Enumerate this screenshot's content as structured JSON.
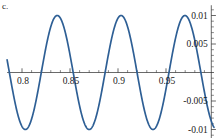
{
  "panel": {
    "label": "c."
  },
  "chart_data": {
    "type": "line",
    "title": "",
    "subtitle": "",
    "xlabel": "",
    "ylabel": "",
    "legend": [],
    "legend_position": "none",
    "grid": false,
    "axis_style": "crosshair-at-origin",
    "xlim": [
      0.7845,
      1.0
    ],
    "ylim": [
      -0.0118,
      0.0118
    ],
    "x_ticks_major": [
      0.8,
      0.85,
      0.9,
      0.95
    ],
    "x_tick_labels": [
      "0.8",
      "0.85",
      "0.9",
      "0.95"
    ],
    "x_ticks_minor": [
      0.81,
      0.82,
      0.83,
      0.84,
      0.86,
      0.87,
      0.88,
      0.89,
      0.91,
      0.92,
      0.93,
      0.94,
      0.96,
      0.97,
      0.98,
      0.99
    ],
    "y_ticks_major": [
      0.01,
      0.005,
      -0.005,
      -0.01
    ],
    "y_tick_labels": [
      "0.01",
      "0.005",
      "-0.005",
      "-0.01"
    ],
    "y_ticks_minor": [
      0.009,
      0.008,
      0.007,
      0.006,
      0.004,
      0.003,
      0.002,
      0.001,
      -0.001,
      -0.002,
      -0.003,
      -0.004,
      -0.006,
      -0.007,
      -0.008,
      -0.009,
      -0.011,
      0.011
    ],
    "y_axis_position": "right",
    "x_axis_position": "y=0",
    "series": [
      {
        "name": "oscillation",
        "color": "#2e5f95",
        "amplitude": 0.01,
        "period": 0.0665,
        "description": "sinusoidal oscillation of amplitude 0.01 with period about 0.0665 in x",
        "x": [
          0.7845,
          0.7878,
          0.7911,
          0.7945,
          0.7978,
          0.8011,
          0.8045,
          0.8078,
          0.8111,
          0.8145,
          0.8178,
          0.8211,
          0.8245,
          0.8278,
          0.8311,
          0.8345,
          0.8378,
          0.8411,
          0.8445,
          0.8478,
          0.8511,
          0.8545,
          0.8578,
          0.8611,
          0.8645,
          0.8678,
          0.8711,
          0.8745,
          0.8778,
          0.8811,
          0.8845,
          0.8878,
          0.8911,
          0.8945,
          0.8978,
          0.9011,
          0.9045,
          0.9078,
          0.9111,
          0.9145,
          0.9178,
          0.9211,
          0.9245,
          0.9278,
          0.9311,
          0.9345,
          0.9378,
          0.9411,
          0.9445,
          0.9478,
          0.9511,
          0.9545,
          0.9578,
          0.9611,
          0.9645,
          0.9678,
          0.9711,
          0.9745,
          0.9778,
          0.9811,
          0.9845,
          0.9878,
          0.9911,
          0.9945,
          0.9978,
          1.0
        ],
        "y": [
          0.0022,
          -0.0009,
          -0.004,
          -0.0066,
          -0.0086,
          -0.0098,
          -0.01,
          -0.0093,
          -0.0077,
          -0.0054,
          -0.0026,
          0.0005,
          0.0035,
          0.0062,
          0.0084,
          0.0097,
          0.01,
          0.0094,
          0.0079,
          0.0057,
          0.003,
          0.0,
          -0.003,
          -0.0058,
          -0.008,
          -0.0095,
          -0.01,
          -0.0096,
          -0.0082,
          -0.0061,
          -0.0034,
          -0.0005,
          0.0026,
          0.0054,
          0.0078,
          0.0093,
          0.01,
          0.0097,
          0.0085,
          0.0065,
          0.0039,
          0.001,
          -0.0021,
          -0.005,
          -0.0074,
          -0.0091,
          -0.0099,
          -0.0098,
          -0.0087,
          -0.0069,
          -0.0044,
          -0.0015,
          0.0016,
          0.0045,
          0.007,
          0.0088,
          0.0098,
          0.0099,
          0.009,
          0.0073,
          0.0049,
          0.0021,
          -0.0011,
          -0.0041,
          -0.0067,
          -0.0086
        ]
      }
    ]
  }
}
